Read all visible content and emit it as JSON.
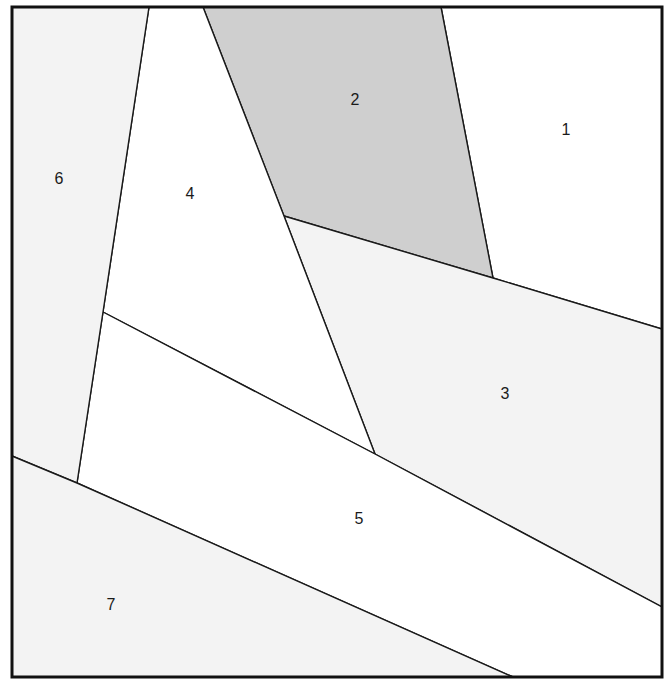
{
  "diagram": {
    "title": "",
    "frame": {
      "x": 12,
      "y": 7,
      "width": 650,
      "height": 670
    },
    "colors": {
      "line": "#1a1a1a",
      "white": "#ffffff",
      "light_gray": "#f3f3f3",
      "medium_gray": "#cfcfcf"
    },
    "regions": [
      {
        "id": "1",
        "label": "1",
        "fill": "#ffffff",
        "label_pos": [
          566,
          130
        ],
        "points": [
          [
            441,
            7
          ],
          [
            662,
            7
          ],
          [
            662,
            329
          ],
          [
            493,
            278
          ]
        ]
      },
      {
        "id": "2",
        "label": "2",
        "fill": "#cfcfcf",
        "label_pos": [
          355,
          100
        ],
        "points": [
          [
            203,
            7
          ],
          [
            441,
            7
          ],
          [
            493,
            278
          ],
          [
            284,
            216
          ]
        ]
      },
      {
        "id": "3",
        "label": "3",
        "fill": "#f3f3f3",
        "label_pos": [
          505,
          394
        ],
        "points": [
          [
            284,
            216
          ],
          [
            493,
            278
          ],
          [
            662,
            329
          ],
          [
            662,
            607
          ],
          [
            375,
            454
          ]
        ]
      },
      {
        "id": "4",
        "label": "4",
        "fill": "#ffffff",
        "label_pos": [
          190,
          194
        ],
        "points": [
          [
            149,
            7
          ],
          [
            203,
            7
          ],
          [
            284,
            216
          ],
          [
            375,
            454
          ],
          [
            103,
            312
          ]
        ]
      },
      {
        "id": "5",
        "label": "5",
        "fill": "#ffffff",
        "label_pos": [
          359,
          519
        ],
        "points": [
          [
            103,
            312
          ],
          [
            375,
            454
          ],
          [
            662,
            607
          ],
          [
            662,
            677
          ],
          [
            513,
            677
          ],
          [
            77,
            483
          ]
        ]
      },
      {
        "id": "6",
        "label": "6",
        "fill": "#f3f3f3",
        "label_pos": [
          59,
          179
        ],
        "points": [
          [
            12,
            7
          ],
          [
            149,
            7
          ],
          [
            103,
            312
          ],
          [
            77,
            483
          ],
          [
            12,
            456
          ]
        ]
      },
      {
        "id": "7",
        "label": "7",
        "fill": "#f3f3f3",
        "label_pos": [
          111,
          605
        ],
        "points": [
          [
            12,
            456
          ],
          [
            77,
            483
          ],
          [
            513,
            677
          ],
          [
            12,
            677
          ]
        ]
      }
    ]
  }
}
